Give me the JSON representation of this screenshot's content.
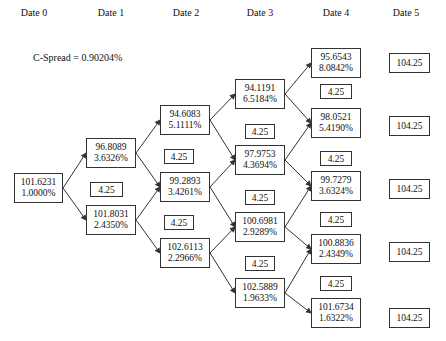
{
  "headers": [
    "Date 0",
    "Date 1",
    "Date 2",
    "Date 3",
    "Date 4",
    "Date 5"
  ],
  "spread_label": "C-Spread = 0.90204%",
  "colors": {
    "line": "#333333",
    "background": "#ffffff",
    "text": "#111111"
  },
  "nodes": {
    "d0": [
      {
        "price": "101.6231",
        "rate": "1.0000%"
      }
    ],
    "d1": [
      {
        "price": "96.8089",
        "rate": "3.6326%"
      },
      {
        "price": "101.8031",
        "rate": "2.4350%"
      }
    ],
    "d2": [
      {
        "price": "94.6083",
        "rate": "5.1111%"
      },
      {
        "price": "99.2893",
        "rate": "3.4261%"
      },
      {
        "price": "102.6113",
        "rate": "2.2966%"
      }
    ],
    "d3": [
      {
        "price": "94.1191",
        "rate": "6.5184%"
      },
      {
        "price": "97.9753",
        "rate": "4.3694%"
      },
      {
        "price": "100.6981",
        "rate": "2.9289%"
      },
      {
        "price": "102.5889",
        "rate": "1.9633%"
      }
    ],
    "d4": [
      {
        "price": "95.6543",
        "rate": "8.0842%"
      },
      {
        "price": "98.0521",
        "rate": "5.4190%"
      },
      {
        "price": "99.7279",
        "rate": "3.6324%"
      },
      {
        "price": "100.8836",
        "rate": "2.4349%"
      },
      {
        "price": "101.6734",
        "rate": "1.6322%"
      }
    ],
    "d5": [
      "104.25",
      "104.25",
      "104.25",
      "104.25",
      "104.25"
    ]
  },
  "coupons": {
    "d1": [
      "4.25"
    ],
    "d2": [
      "4.25",
      "4.25"
    ],
    "d3": [
      "4.25",
      "4.25",
      "4.25"
    ],
    "d4": [
      "4.25",
      "4.25",
      "4.25",
      "4.25"
    ]
  }
}
